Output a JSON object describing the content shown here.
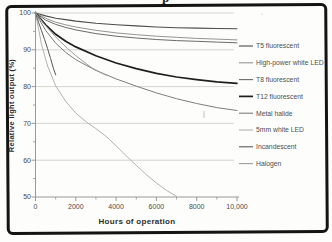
{
  "figure": {
    "cropped_caption_fragment": "p"
  },
  "chart_data": {
    "type": "line",
    "title": "",
    "xlabel": "Hours of operation",
    "ylabel": "Relative light output (%)",
    "xlim": [
      0,
      10000
    ],
    "ylim": [
      50,
      100
    ],
    "grid": "horizontal-major-only",
    "legend_position": "right",
    "x_ticks": {
      "major": [
        0,
        2000,
        4000,
        6000,
        8000,
        10000
      ],
      "labels": [
        "0",
        "2000",
        "4000",
        "6000",
        "8000",
        "10,000"
      ],
      "minor": [
        1000,
        3000,
        5000,
        7000,
        9000
      ]
    },
    "y_ticks": {
      "major": [
        100,
        90,
        80,
        70,
        60,
        50
      ],
      "labels": [
        "100",
        "90",
        "80",
        "70",
        "60",
        "50"
      ],
      "minor": [
        95,
        85,
        75,
        65,
        55
      ],
      "gridlines_at": [
        100,
        90,
        80,
        70,
        60
      ]
    },
    "style": {
      "axis_color": "#8f8f8f",
      "grid_color": "#c9c9c9",
      "tick_label_color": "#4a4a4a",
      "legend_text_color": "#4f4f4f",
      "frame_color": "#141414"
    },
    "series": [
      {
        "name": "T5 fluorescent",
        "slug": "t5-fluorescent",
        "color": "#4d4d4d",
        "width": 1.1,
        "points": [
          [
            0,
            100
          ],
          [
            500,
            99.2
          ],
          [
            1000,
            98.6
          ],
          [
            1500,
            98.2
          ],
          [
            2000,
            97.8
          ],
          [
            3000,
            97.2
          ],
          [
            4000,
            96.8
          ],
          [
            5000,
            96.5
          ],
          [
            6000,
            96.2
          ],
          [
            7000,
            96.0
          ],
          [
            8000,
            95.9
          ],
          [
            9000,
            95.8
          ],
          [
            10000,
            95.7
          ]
        ]
      },
      {
        "name": "High-power white LED",
        "slug": "high-power-white-led",
        "color": "#949494",
        "width": 1,
        "points": [
          [
            0,
            100
          ],
          [
            500,
            98.6
          ],
          [
            1000,
            97.5
          ],
          [
            1500,
            96.8
          ],
          [
            2000,
            96.2
          ],
          [
            3000,
            95.3
          ],
          [
            4000,
            94.6
          ],
          [
            5000,
            94.1
          ],
          [
            6000,
            93.7
          ],
          [
            7000,
            93.4
          ],
          [
            8000,
            93.1
          ],
          [
            9000,
            92.9
          ],
          [
            10000,
            92.7
          ]
        ]
      },
      {
        "name": "T8 fluorescent",
        "slug": "t8-fluorescent",
        "color": "#6b6b6b",
        "width": 1,
        "points": [
          [
            0,
            100
          ],
          [
            500,
            98.1
          ],
          [
            1000,
            96.9
          ],
          [
            1500,
            96.1
          ],
          [
            2000,
            95.4
          ],
          [
            3000,
            94.4
          ],
          [
            4000,
            93.7
          ],
          [
            5000,
            93.2
          ],
          [
            6000,
            92.8
          ],
          [
            7000,
            92.5
          ],
          [
            8000,
            92.3
          ],
          [
            9000,
            92.1
          ],
          [
            10000,
            91.9
          ]
        ]
      },
      {
        "name": "T12 fluorescent",
        "slug": "t12-fluorescent",
        "color": "#1f1f1f",
        "width": 1.7,
        "points": [
          [
            0,
            100
          ],
          [
            500,
            96.8
          ],
          [
            1000,
            94.2
          ],
          [
            1500,
            92.3
          ],
          [
            2000,
            90.8
          ],
          [
            3000,
            88.4
          ],
          [
            4000,
            86.4
          ],
          [
            5000,
            84.9
          ],
          [
            6000,
            83.6
          ],
          [
            7000,
            82.6
          ],
          [
            8000,
            81.9
          ],
          [
            9000,
            81.3
          ],
          [
            10000,
            80.9
          ]
        ]
      },
      {
        "name": "Metal halide",
        "slug": "metal-halide",
        "color": "#7d7d7d",
        "width": 1,
        "points": [
          [
            0,
            100
          ],
          [
            500,
            95.3
          ],
          [
            1000,
            91.8
          ],
          [
            1500,
            89.3
          ],
          [
            2000,
            87.3
          ],
          [
            3000,
            84.4
          ],
          [
            4000,
            82.1
          ],
          [
            5000,
            80.1
          ],
          [
            6000,
            78.3
          ],
          [
            7000,
            76.7
          ],
          [
            8000,
            75.4
          ],
          [
            9000,
            74.3
          ],
          [
            10000,
            73.5
          ]
        ]
      },
      {
        "name": "5mm white LED",
        "slug": "5mm-white-led",
        "color": "#b3b3b3",
        "width": 1,
        "points": [
          [
            0,
            100
          ],
          [
            300,
            91.5
          ],
          [
            600,
            85.6
          ],
          [
            1000,
            80.2
          ],
          [
            1500,
            76.0
          ],
          [
            2000,
            72.8
          ],
          [
            2500,
            70.5
          ],
          [
            3000,
            68.6
          ],
          [
            3500,
            66.5
          ],
          [
            4000,
            63.9
          ],
          [
            4500,
            61.2
          ],
          [
            5000,
            58.6
          ],
          [
            5500,
            56.1
          ],
          [
            6000,
            53.8
          ],
          [
            6500,
            51.8
          ],
          [
            7000,
            50.2
          ]
        ]
      },
      {
        "name": "Incandescent",
        "slug": "incandescent",
        "color": "#595959",
        "width": 1,
        "points": [
          [
            0,
            100
          ],
          [
            150,
            97.5
          ],
          [
            300,
            95.2
          ],
          [
            450,
            92.8
          ],
          [
            600,
            90.3
          ],
          [
            750,
            87.6
          ],
          [
            900,
            84.8
          ],
          [
            1000,
            83.2
          ]
        ]
      },
      {
        "name": "Halogen",
        "slug": "halogen",
        "color": "#9e9e9e",
        "width": 1,
        "points": [
          [
            0,
            100
          ],
          [
            400,
            97.2
          ],
          [
            800,
            94.7
          ],
          [
            1200,
            92.4
          ],
          [
            1600,
            90.3
          ],
          [
            2000,
            88.4
          ],
          [
            2400,
            86.7
          ],
          [
            2800,
            85.1
          ],
          [
            3200,
            83.9
          ],
          [
            3500,
            83.1
          ]
        ]
      }
    ]
  }
}
